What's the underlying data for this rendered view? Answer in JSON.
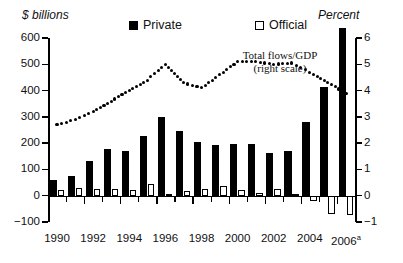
{
  "chart_data": {
    "type": "bar",
    "title": "",
    "xlabel": "",
    "ylabel": "$ billions",
    "ylabel_right": "Percent",
    "ylim": [
      -100,
      600
    ],
    "ylim_right": [
      -1,
      6
    ],
    "grid": false,
    "yticks": [
      600,
      500,
      400,
      300,
      200,
      100,
      0,
      -100
    ],
    "yticks_right": [
      6,
      5,
      4,
      3,
      2,
      1,
      0,
      -1
    ],
    "categories": [
      "1990",
      "1991",
      "1992",
      "1993",
      "1994",
      "1995",
      "1996",
      "1997",
      "1998",
      "1999",
      "2000",
      "2001",
      "2002",
      "2003",
      "2004",
      "2005",
      "2006"
    ],
    "xtick_labels": [
      "1990",
      "",
      "1992",
      "",
      "1994",
      "",
      "1996",
      "",
      "1998",
      "",
      "2000",
      "",
      "2002",
      "",
      "2004",
      "",
      "2006"
    ],
    "last_category_superscript": "a",
    "series": [
      {
        "name": "Private",
        "type": "bar",
        "axis": "left",
        "color": "#000000",
        "fill": "solid",
        "values": [
          58,
          75,
          132,
          178,
          171,
          228,
          298,
          248,
          204,
          194,
          195,
          196,
          161,
          172,
          280,
          413,
          640
        ]
      },
      {
        "name": "Official",
        "type": "bar",
        "axis": "left",
        "color": "#ffffff",
        "fill": "hollow",
        "values": [
          22,
          30,
          25,
          26,
          21,
          43,
          6,
          17,
          25,
          36,
          20,
          9,
          25,
          7,
          -22,
          -70,
          -73
        ]
      },
      {
        "name": "Total flows/GDP (right scale)",
        "type": "line",
        "style": "dotted",
        "axis": "right",
        "color": "#000000",
        "values": [
          2.7,
          2.9,
          3.2,
          3.6,
          4.0,
          4.4,
          5.0,
          4.3,
          4.1,
          4.6,
          5.1,
          5.1,
          5.0,
          5.05,
          4.7,
          4.3,
          3.9
        ]
      }
    ],
    "annotations": [
      {
        "text": "Total flows/GDP\n(right scale)",
        "line1": "Total flows/GDP",
        "line2": "(right scale)"
      }
    ],
    "legend": {
      "position": "top",
      "entries": [
        {
          "label": "Private",
          "swatch": "filled-square"
        },
        {
          "label": "Official",
          "swatch": "hollow-square"
        }
      ]
    }
  },
  "labels": {
    "y_axis_title_left": "$ billions",
    "y_axis_title_right": "Percent",
    "legend_private": "Private",
    "legend_official": "Official",
    "annotation_line1": "Total flows/GDP",
    "annotation_line2": "(right scale)",
    "superscript_a": "a"
  },
  "colors": {
    "background": "#ffffff",
    "foreground": "#000000",
    "private_bar": "#000000",
    "official_bar": "#ffffff"
  }
}
